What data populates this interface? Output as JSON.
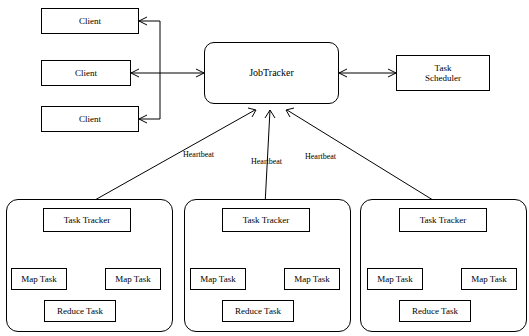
{
  "diagram": {
    "nodes": {
      "client1": "Client",
      "client2": "Client",
      "client3": "Client",
      "jobtracker": "JobTracker",
      "task_scheduler": "Task\nScheduler",
      "tasktracker1": "Task Tracker",
      "tasktracker2": "Task Tracker",
      "tasktracker3": "Task Tracker",
      "map_task_1a": "Map Task",
      "map_task_1b": "Map Task",
      "reduce_task_1": "Reduce Task",
      "map_task_2a": "Map Task",
      "map_task_2b": "Map Task",
      "reduce_task_2": "Reduce Task",
      "map_task_3a": "Map Task",
      "map_task_3b": "Map Task",
      "reduce_task_3": "Reduce Task"
    },
    "edge_labels": {
      "heartbeat1": "Heartbeat",
      "heartbeat2": "Heartbeat",
      "heartbeat3": "Heartbeat"
    },
    "colors": {
      "stroke": "#000000",
      "fill": "#ffffff",
      "text": "#000000"
    }
  }
}
